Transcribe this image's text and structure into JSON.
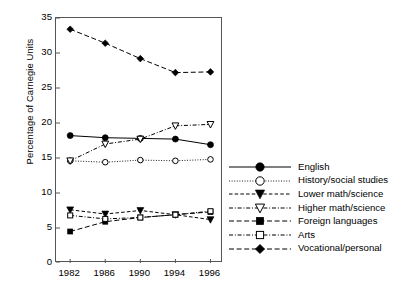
{
  "chart_data": {
    "type": "line",
    "title": "",
    "xlabel": "",
    "ylabel": "Percentage of Carnegie Units",
    "ylim": [
      0,
      35
    ],
    "yticks": [
      0,
      5,
      10,
      15,
      20,
      25,
      30,
      35
    ],
    "categories": [
      "1982",
      "1986",
      "1990",
      "1994",
      "1996"
    ],
    "grid": false,
    "legend_position": "right",
    "series": [
      {
        "name": "English",
        "marker": "filled-circle",
        "line_style": "solid",
        "values": [
          18.2,
          17.9,
          17.8,
          17.7,
          16.9
        ]
      },
      {
        "name": "History/social studies",
        "marker": "open-circle",
        "line_style": "dotted",
        "values": [
          14.6,
          14.4,
          14.7,
          14.6,
          14.8
        ]
      },
      {
        "name": "Lower math/science",
        "marker": "filled-down-triangle",
        "line_style": "dashed",
        "values": [
          7.6,
          7.0,
          7.5,
          6.9,
          6.2
        ]
      },
      {
        "name": "Higher math/science",
        "marker": "open-down-triangle",
        "line_style": "dash-dot",
        "values": [
          14.6,
          17.0,
          17.7,
          19.6,
          19.8
        ]
      },
      {
        "name": "Foreign languages",
        "marker": "filled-square",
        "line_style": "long-dash",
        "values": [
          4.5,
          5.9,
          6.5,
          6.9,
          7.3
        ]
      },
      {
        "name": "Arts",
        "marker": "open-square",
        "line_style": "dash-dot",
        "values": [
          6.8,
          6.3,
          6.5,
          6.9,
          7.4
        ]
      },
      {
        "name": "Vocational/personal",
        "marker": "filled-diamond",
        "line_style": "long-dash",
        "values": [
          33.4,
          31.4,
          29.2,
          27.2,
          27.3
        ]
      }
    ]
  },
  "legend": {
    "items": [
      {
        "label": "English"
      },
      {
        "label": "History/social studies"
      },
      {
        "label": "Lower math/science"
      },
      {
        "label": "Higher math/science"
      },
      {
        "label": "Foreign languages"
      },
      {
        "label": "Arts"
      },
      {
        "label": "Vocational/personal"
      }
    ]
  },
  "colors": {
    "ink": "#000000",
    "axis": "#555555",
    "background": "#ffffff"
  }
}
